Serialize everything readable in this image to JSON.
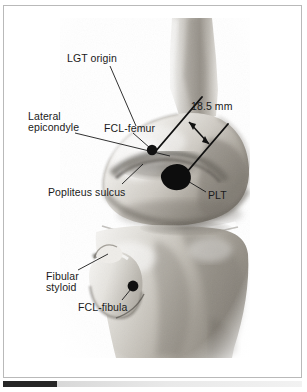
{
  "figure": {
    "type": "anatomical-photograph",
    "view": "lateral",
    "background_color": "#ffffff",
    "ink_color": "#1a1a1a",
    "frame_color": "#b9b9b9"
  },
  "labels": {
    "lgt_origin": "LGT origin",
    "lateral_epicondyle_line1": "Lateral",
    "lateral_epicondyle_line2": "epicondyle",
    "fcl_femur": "FCL-femur",
    "measurement": "18.5 mm",
    "popliteus_sulcus": "Popliteus sulcus",
    "plt": "PLT",
    "fibular_styloid_line1": "Fibular",
    "fibular_styloid_line2": "styloid",
    "fcl_fibula": "FCL-fibula"
  },
  "measurements": [
    {
      "label": "18.5 mm",
      "value": 18.5,
      "unit": "mm",
      "between": [
        "FCL-femur attachment",
        "PLT attachment"
      ]
    }
  ],
  "markers": [
    {
      "name": "fcl-femur-marker",
      "label": "FCL-femur",
      "shape": "small-round-dot",
      "color": "#111111",
      "x": 152,
      "y": 150
    },
    {
      "name": "plt-marker",
      "label": "PLT",
      "shape": "large-irregular-blob",
      "color": "#0d0d0d",
      "x": 176,
      "y": 177
    },
    {
      "name": "fcl-fibula-marker",
      "label": "FCL-fibula",
      "shape": "small-round-dot",
      "color": "#111111",
      "x": 133,
      "y": 286
    }
  ],
  "leader_lines": [
    {
      "from": "LGT origin",
      "to_point": [
        136,
        126
      ]
    },
    {
      "from": "Lateral epicondyle",
      "to_point": [
        170,
        155
      ]
    },
    {
      "from": "FCL-femur",
      "to_point": [
        150,
        149
      ]
    },
    {
      "from": "Popliteus sulcus",
      "to_point": [
        140,
        168
      ]
    },
    {
      "from": "PLT",
      "to_point": [
        186,
        181
      ]
    },
    {
      "from": "Fibular styloid",
      "to_point": [
        108,
        256
      ]
    },
    {
      "from": "FCL-fibula",
      "to_point": [
        131,
        288
      ]
    }
  ],
  "bottom_bar": {
    "name": "scale-bar",
    "color": "#262626"
  }
}
